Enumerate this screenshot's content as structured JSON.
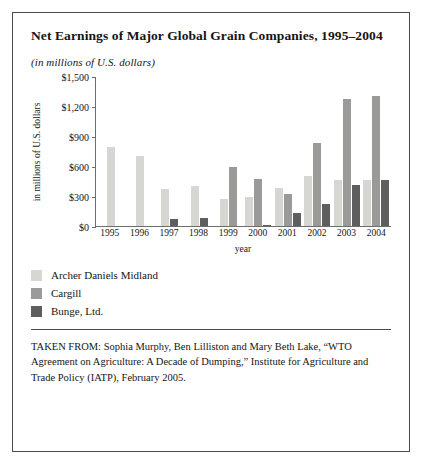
{
  "figure": {
    "title": "Net Earnings of Major Global Grain Companies, 1995–2004",
    "subtitle": "(in millions of U.S. dollars)",
    "source": "TAKEN FROM: Sophia Murphy, Ben Lilliston and Mary Beth Lake, “WTO Agreement on Agriculture: A Decade of Dumping,” Institute for Agriculture and Trade Policy (IATP), February 2005."
  },
  "colors": {
    "adm": "#d6d6d2",
    "cargill": "#9a9a98",
    "bunge": "#5e5e5e",
    "axis": "#6d6d6d",
    "border": "#4a4a4a",
    "text": "#151515"
  },
  "legend": [
    {
      "label": "Archer Daniels Midland",
      "color": "#d6d6d2",
      "key": "adm"
    },
    {
      "label": "Cargill",
      "color": "#9a9a98",
      "key": "cargill"
    },
    {
      "label": "Bunge, Ltd.",
      "color": "#5e5e5e",
      "key": "bunge"
    }
  ],
  "chart_data": {
    "type": "bar",
    "title": "Net Earnings of Major Global Grain Companies, 1995–2004",
    "subtitle": "(in millions of U.S. dollars)",
    "xlabel": "year",
    "ylabel": "in millions of U.S. dollars",
    "categories": [
      "1995",
      "1996",
      "1997",
      "1998",
      "1999",
      "2000",
      "2001",
      "2002",
      "2003",
      "2004"
    ],
    "ylim": [
      0,
      1500
    ],
    "yticks": [
      0,
      300,
      600,
      900,
      1200,
      1500
    ],
    "yticklabels": [
      "$0",
      "$300",
      "$600",
      "$900",
      "$1,200",
      "$1,500"
    ],
    "grid": false,
    "legend_position": "below-plot-left",
    "series": [
      {
        "name": "Archer Daniels Midland",
        "color": "#d6d6d2",
        "values": [
          790,
          700,
          375,
          400,
          270,
          290,
          380,
          500,
          460,
          460
        ]
      },
      {
        "name": "Cargill",
        "color": "#9a9a98",
        "values": [
          null,
          null,
          null,
          null,
          597,
          470,
          320,
          830,
          1270,
          1300
        ]
      },
      {
        "name": "Bunge, Ltd.",
        "color": "#5e5e5e",
        "values": [
          null,
          null,
          75,
          85,
          null,
          10,
          130,
          220,
          410,
          460
        ]
      }
    ]
  }
}
